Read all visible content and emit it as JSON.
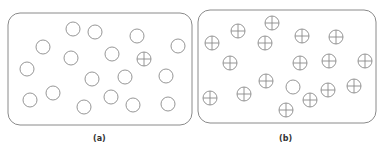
{
  "panels": [
    {
      "id": "a",
      "label": "(a)",
      "box": {
        "x": 8,
        "y": 13,
        "w": 184,
        "h": 112,
        "r": 12
      },
      "label_pos": {
        "x": 93,
        "y": 134
      },
      "particles": [
        {
          "x": 73,
          "y": 29,
          "type": "plain"
        },
        {
          "x": 95,
          "y": 32,
          "type": "plain"
        },
        {
          "x": 137,
          "y": 36,
          "type": "plain"
        },
        {
          "x": 43,
          "y": 47,
          "type": "plain"
        },
        {
          "x": 178,
          "y": 46,
          "type": "plain"
        },
        {
          "x": 71,
          "y": 58,
          "type": "plain"
        },
        {
          "x": 112,
          "y": 54,
          "type": "plain"
        },
        {
          "x": 144,
          "y": 59,
          "type": "cross"
        },
        {
          "x": 27,
          "y": 69,
          "type": "plain"
        },
        {
          "x": 92,
          "y": 79,
          "type": "plain"
        },
        {
          "x": 125,
          "y": 77,
          "type": "plain"
        },
        {
          "x": 166,
          "y": 76,
          "type": "plain"
        },
        {
          "x": 53,
          "y": 93,
          "type": "plain"
        },
        {
          "x": 30,
          "y": 100,
          "type": "plain"
        },
        {
          "x": 111,
          "y": 97,
          "type": "plain"
        },
        {
          "x": 84,
          "y": 107,
          "type": "plain"
        },
        {
          "x": 133,
          "y": 105,
          "type": "plain"
        },
        {
          "x": 168,
          "y": 104,
          "type": "plain"
        }
      ]
    },
    {
      "id": "b",
      "label": "(b)",
      "box": {
        "x": 198,
        "y": 10,
        "w": 178,
        "h": 113,
        "r": 12
      },
      "label_pos": {
        "x": 279,
        "y": 134
      },
      "particles": [
        {
          "x": 238,
          "y": 31,
          "type": "cross"
        },
        {
          "x": 272,
          "y": 23,
          "type": "cross"
        },
        {
          "x": 212,
          "y": 43,
          "type": "cross"
        },
        {
          "x": 265,
          "y": 43,
          "type": "cross"
        },
        {
          "x": 302,
          "y": 36,
          "type": "cross"
        },
        {
          "x": 336,
          "y": 37,
          "type": "cross"
        },
        {
          "x": 230,
          "y": 63,
          "type": "cross"
        },
        {
          "x": 300,
          "y": 63,
          "type": "cross"
        },
        {
          "x": 329,
          "y": 61,
          "type": "cross"
        },
        {
          "x": 365,
          "y": 61,
          "type": "cross"
        },
        {
          "x": 266,
          "y": 81,
          "type": "cross"
        },
        {
          "x": 293,
          "y": 87,
          "type": "plain"
        },
        {
          "x": 328,
          "y": 90,
          "type": "cross"
        },
        {
          "x": 354,
          "y": 86,
          "type": "cross"
        },
        {
          "x": 210,
          "y": 98,
          "type": "cross"
        },
        {
          "x": 244,
          "y": 94,
          "type": "cross"
        },
        {
          "x": 310,
          "y": 100,
          "type": "cross"
        },
        {
          "x": 286,
          "y": 110,
          "type": "cross"
        }
      ]
    }
  ],
  "style": {
    "stroke": "#8a8a8a",
    "particle_radius": 7
  }
}
